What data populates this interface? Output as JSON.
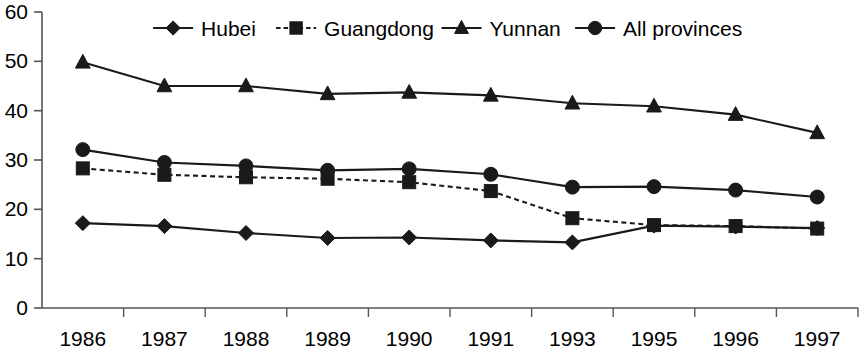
{
  "chart_data": {
    "type": "line",
    "title": "",
    "xlabel": "",
    "ylabel": "",
    "categories": [
      "1986",
      "1987",
      "1988",
      "1989",
      "1990",
      "1991",
      "1993",
      "1995",
      "1996",
      "1997"
    ],
    "ylim": [
      0,
      60
    ],
    "yticks": [
      0,
      10,
      20,
      30,
      40,
      50,
      60
    ],
    "grid": false,
    "legend_position": "top",
    "series": [
      {
        "name": "Hubei",
        "marker": "diamond",
        "line_style": "solid",
        "color": "#1a1a1a",
        "values": [
          17.2,
          16.6,
          15.2,
          14.2,
          14.3,
          13.7,
          13.3,
          16.7,
          16.5,
          16.2
        ]
      },
      {
        "name": "Guangdong",
        "marker": "square",
        "line_style": "dashed",
        "color": "#1a1a1a",
        "values": [
          28.3,
          27.0,
          26.5,
          26.2,
          25.5,
          23.7,
          18.2,
          16.8,
          16.6,
          16.1
        ]
      },
      {
        "name": "Yunnan",
        "marker": "triangle",
        "line_style": "solid",
        "color": "#1a1a1a",
        "values": [
          49.8,
          45.0,
          45.0,
          43.4,
          43.7,
          43.1,
          41.5,
          40.9,
          39.2,
          35.5
        ]
      },
      {
        "name": "All provinces",
        "marker": "circle",
        "line_style": "solid",
        "color": "#1a1a1a",
        "values": [
          32.1,
          29.5,
          28.8,
          27.9,
          28.2,
          27.1,
          24.5,
          24.6,
          23.9,
          22.5
        ]
      }
    ]
  },
  "legend": {
    "items": [
      {
        "label": "Hubei",
        "marker": "diamond",
        "style": "solid"
      },
      {
        "label": "Guangdong",
        "marker": "square",
        "style": "dashed"
      },
      {
        "label": "Yunnan",
        "marker": "triangle",
        "style": "solid"
      },
      {
        "label": "All provinces",
        "marker": "circle",
        "style": "solid"
      }
    ]
  },
  "axes": {
    "y_tick_labels": [
      "60",
      "50",
      "40",
      "30",
      "20",
      "10",
      "0"
    ],
    "x_tick_labels": [
      "1986",
      "1987",
      "1988",
      "1989",
      "1990",
      "1991",
      "1993",
      "1995",
      "1996",
      "1997"
    ]
  },
  "colors": {
    "ink": "#1a1a1a",
    "axis": "#555555",
    "background": "#ffffff"
  }
}
